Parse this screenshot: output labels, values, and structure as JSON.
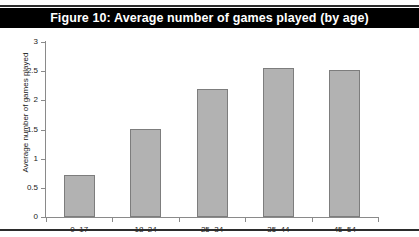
{
  "figure": {
    "title": "Figure 10: Average number of games played (by age)",
    "title_band_color": "#000000",
    "title_text_color": "#ffffff",
    "rule_color": "#2b2b2b",
    "background_color": "#ffffff"
  },
  "chart_data": {
    "type": "bar",
    "title": "Figure 10: Average number of games played (by age)",
    "categories": [
      "0–17",
      "18–24",
      "25–34",
      "35–44",
      "45–54"
    ],
    "values": [
      0.72,
      1.51,
      2.19,
      2.55,
      2.52
    ],
    "series": [
      {
        "name": "Average number of games played",
        "values": [
          0.72,
          1.51,
          2.19,
          2.55,
          2.52
        ]
      }
    ],
    "xlabel": "Age",
    "ylabel": "Average number of games played",
    "ylim": [
      0,
      3
    ],
    "ytick_labels": [
      "0",
      "0.5",
      "1",
      "1.5",
      "2",
      "2.5",
      "3"
    ],
    "ytick_values": [
      0,
      0.5,
      1,
      1.5,
      2,
      2.5,
      3
    ],
    "grid": false,
    "legend": null,
    "bar_fill_color": "#b2b2b2",
    "bar_border_color": "#7d7d7d",
    "axis_color": "#8a8a8a"
  }
}
